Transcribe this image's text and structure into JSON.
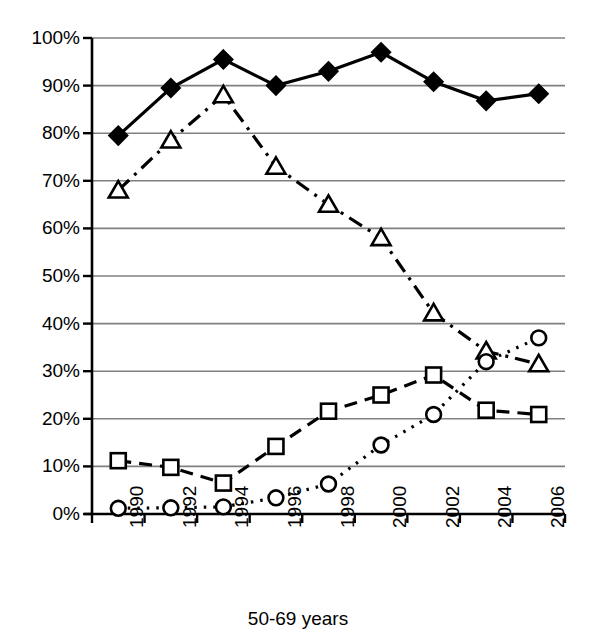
{
  "chart_data": {
    "type": "line",
    "title": "",
    "xlabel": "50-69 years",
    "ylabel": "",
    "x": [
      1990,
      1992,
      1994,
      1996,
      1998,
      2000,
      2002,
      2004,
      2006
    ],
    "categories": [
      "1990",
      "1992",
      "1994",
      "1996",
      "1998",
      "2000",
      "2002",
      "2004",
      "2006"
    ],
    "ylim": [
      0,
      100
    ],
    "xlim": [
      1989,
      2007
    ],
    "ytick_labels": [
      "0%",
      "10%",
      "20%",
      "30%",
      "40%",
      "50%",
      "60%",
      "70%",
      "80%",
      "90%",
      "100%"
    ],
    "ytick_values": [
      0,
      10,
      20,
      30,
      40,
      50,
      60,
      70,
      80,
      90,
      100
    ],
    "grid": "horizontal",
    "legend": "none",
    "series": [
      {
        "name": "series-diamond",
        "marker": "filled-diamond",
        "line_style": "solid",
        "values": [
          79.5,
          89.5,
          95.5,
          90.0,
          93.0,
          97.0,
          90.8,
          86.8,
          88.3
        ]
      },
      {
        "name": "series-triangle",
        "marker": "open-triangle",
        "line_style": "dash-dot",
        "values": [
          68.0,
          78.5,
          88.0,
          73.0,
          65.0,
          58.0,
          42.2,
          34.2,
          31.5
        ]
      },
      {
        "name": "series-square",
        "marker": "open-square",
        "line_style": "dashed",
        "values": [
          11.2,
          9.8,
          6.5,
          14.2,
          21.6,
          25.0,
          29.2,
          21.8,
          20.9
        ]
      },
      {
        "name": "series-circle",
        "marker": "open-circle",
        "line_style": "dotted",
        "values": [
          1.2,
          1.3,
          1.5,
          3.4,
          6.3,
          14.5,
          20.9,
          32.0,
          37.0
        ]
      }
    ]
  },
  "axis": {
    "x_title": "50-69 years"
  },
  "colors": {
    "foreground": "#000000",
    "gridline": "#808080",
    "background": "#ffffff"
  }
}
